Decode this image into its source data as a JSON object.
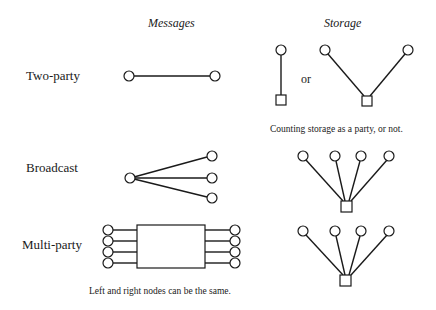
{
  "columns": {
    "messages": "Messages",
    "storage": "Storage"
  },
  "rows": [
    {
      "label": "Two-party"
    },
    {
      "label": "Broadcast"
    },
    {
      "label": "Multi-party"
    }
  ],
  "storage_two_party": {
    "or_label": "or",
    "caption": "Counting storage as a party, or not."
  },
  "multi_party_caption": "Left and right nodes can be the same.",
  "legend": {
    "circle": "node-party",
    "square": "storage",
    "rectangle": "multi-party-channel"
  },
  "colors": {
    "stroke": "#1a1a1a",
    "fill": "#ffffff",
    "background": "#ffffff"
  }
}
